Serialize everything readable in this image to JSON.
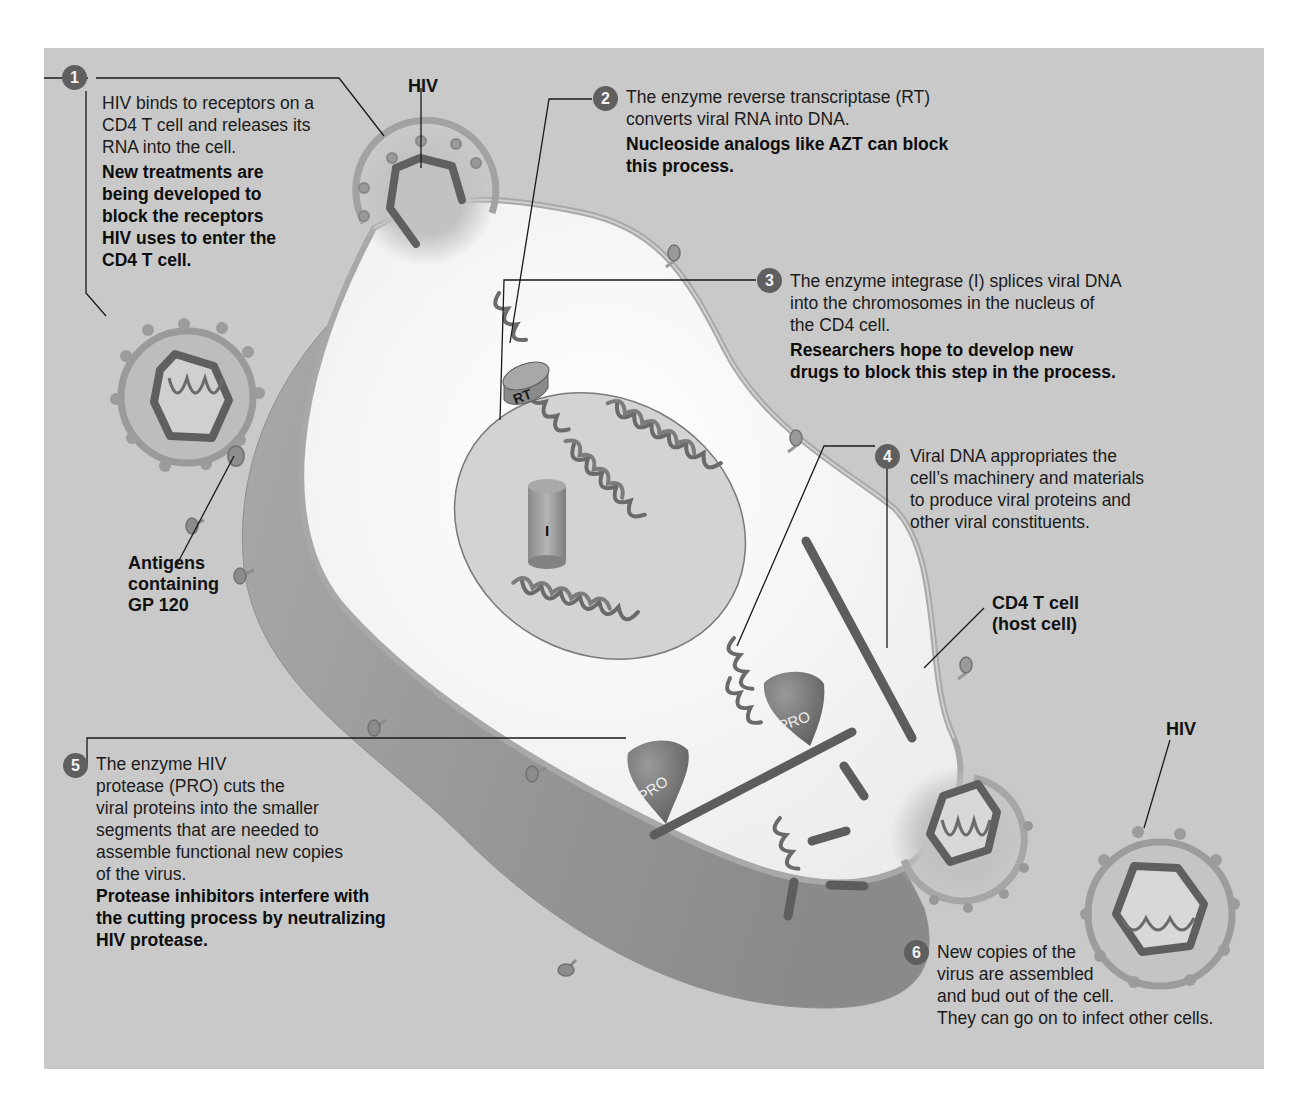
{
  "diagram": {
    "colors": {
      "background": "#c9c9c9",
      "cytoplasm": "#f4f4f4",
      "nucleus": "#d2d2d2",
      "membrane": "#b0b0b0",
      "strand": "#6a6a6a",
      "badge": "#5f5f5f"
    },
    "labels": {
      "hiv_top": "HIV",
      "hiv_right": "HIV",
      "antigens": [
        "Antigens",
        "containing",
        "GP 120"
      ],
      "host_cell": [
        "CD4 T cell",
        "(host cell)"
      ],
      "rt": "RT",
      "integrase": "I",
      "protease_a": "PRO",
      "protease_b": "PRO"
    },
    "steps": [
      {
        "number": "1",
        "text": [
          "HIV binds to receptors on a",
          "CD4 T cell and releases its",
          "RNA into the cell."
        ],
        "bold": [
          "New treatments are",
          "being developed to",
          "block the receptors",
          "HIV uses to enter the",
          "CD4 T cell."
        ]
      },
      {
        "number": "2",
        "text": [
          "The enzyme reverse transcriptase (RT)",
          "converts viral RNA into DNA."
        ],
        "bold": [
          "Nucleoside analogs like AZT can block",
          "this process."
        ]
      },
      {
        "number": "3",
        "text": [
          "The enzyme integrase (I) splices viral DNA",
          "into the chromosomes in the nucleus of",
          "the CD4 cell."
        ],
        "bold": [
          "Researchers hope to develop new",
          "drugs to block this step in the process."
        ]
      },
      {
        "number": "4",
        "text": [
          "Viral DNA appropriates the",
          "cell’s machinery and materials",
          "to produce viral proteins and",
          "other viral constituents."
        ],
        "bold": []
      },
      {
        "number": "5",
        "text": [
          "The enzyme HIV",
          "protease (PRO) cuts the",
          "viral proteins into the smaller",
          "segments that are needed to",
          "assemble functional new copies",
          "of the virus."
        ],
        "bold": [
          "Protease inhibitors interfere with",
          "the cutting process by neutralizing",
          "HIV protease."
        ]
      },
      {
        "number": "6",
        "text": [
          "New copies of the",
          "virus are assembled",
          "and bud out of the cell.",
          "They can go on to infect other cells."
        ],
        "bold": []
      }
    ]
  }
}
